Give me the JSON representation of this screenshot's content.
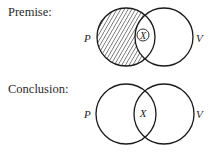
{
  "premise": {
    "heading": "Premise:",
    "circles": [
      {
        "label": "P",
        "cx": 126,
        "cy": 37,
        "r": 29,
        "shaded": true
      },
      {
        "label": "V",
        "cx": 164,
        "cy": 37,
        "r": 29,
        "shaded": false
      }
    ],
    "marker": {
      "text": "X",
      "circled": true,
      "cx": 143,
      "cy": 35
    }
  },
  "conclusion": {
    "heading": "Conclusion:",
    "circles": [
      {
        "label": "P",
        "cx": 126,
        "cy": 114,
        "r": 30,
        "shaded": false
      },
      {
        "label": "V",
        "cx": 164,
        "cy": 114,
        "r": 30,
        "shaded": false
      }
    ],
    "marker": {
      "text": "X",
      "circled": false,
      "cx": 143,
      "cy": 113
    }
  },
  "colors": {
    "stroke": "#1a1a1a",
    "hatch": "#333333",
    "background": "#ffffff"
  }
}
